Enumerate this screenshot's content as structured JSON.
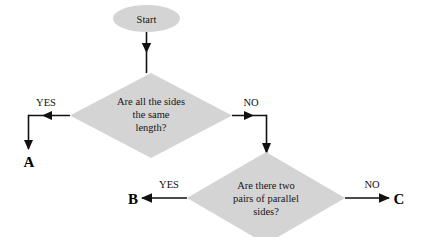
{
  "diagram": {
    "colors": {
      "shape_fill": "#d4d4d4",
      "line": "#111111",
      "text": "#151515",
      "background": "#ffffff"
    },
    "start_node": {
      "shape": "ellipse",
      "label": "Start"
    },
    "decision_1": {
      "shape": "diamond",
      "line1": "Are all the sides",
      "line2": "the same",
      "line3": "length?",
      "yes_label": "YES",
      "no_label": "NO"
    },
    "decision_2": {
      "shape": "diamond",
      "line1": "Are there two",
      "line2": "pairs of  parallel",
      "line3": "sides?",
      "yes_label": "YES",
      "no_label": "NO"
    },
    "terminal_a": "A",
    "terminal_b": "B",
    "terminal_c": "C"
  }
}
